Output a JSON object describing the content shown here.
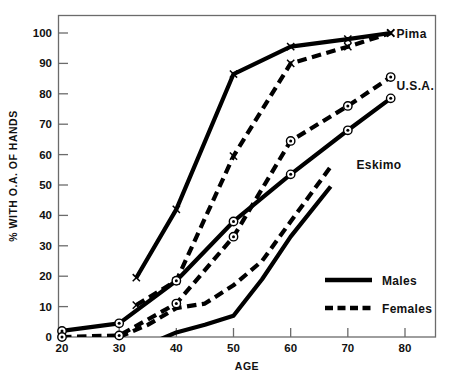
{
  "chart_data": {
    "type": "line",
    "title": "",
    "xlabel": "AGE",
    "ylabel": "% WITH O.A. OF HANDS",
    "xlim": [
      20,
      82
    ],
    "ylim": [
      -3,
      106
    ],
    "xticks": [
      "20",
      "30",
      "40",
      "50",
      "60",
      "70",
      "80"
    ],
    "yticks": [
      "0",
      "10",
      "20",
      "30",
      "40",
      "50",
      "60",
      "70",
      "80",
      "90",
      "100"
    ],
    "grid": false,
    "legend_position": "inside-lower-right",
    "annotations": [
      {
        "text": "Pima",
        "x": 78.5,
        "y": 100
      },
      {
        "text": "U.S.A.",
        "x": 78.5,
        "y": 83
      },
      {
        "text": "Eskimo",
        "x": 71.5,
        "y": 57
      }
    ],
    "legend": [
      {
        "label": "Males",
        "style": "solid"
      },
      {
        "label": "Females",
        "style": "dashed"
      }
    ],
    "series": [
      {
        "name": "Pima Males",
        "group": "Pima",
        "sex": "Males",
        "style": "solid",
        "marker": "x",
        "x": [
          33,
          40,
          50,
          60,
          70,
          77.5
        ],
        "y": [
          19.5,
          42,
          86.5,
          95.5,
          98,
          100
        ]
      },
      {
        "name": "Pima Females",
        "group": "Pima",
        "sex": "Females",
        "style": "dashed",
        "marker": "x",
        "x": [
          33,
          40,
          50,
          60,
          70,
          77.5
        ],
        "y": [
          10.5,
          18.5,
          59.5,
          90,
          95.5,
          100
        ]
      },
      {
        "name": "U.S.A. Males",
        "group": "U.S.A.",
        "sex": "Males",
        "style": "solid",
        "marker": "circle-dot",
        "x": [
          20,
          30,
          40,
          50,
          60,
          70,
          77.5
        ],
        "y": [
          2,
          4.5,
          18.5,
          38,
          53.5,
          68,
          78.5
        ]
      },
      {
        "name": "U.S.A. Females",
        "group": "U.S.A.",
        "sex": "Females",
        "style": "dashed",
        "marker": "circle-dot",
        "x": [
          20,
          30,
          40,
          50,
          60,
          70,
          77.5
        ],
        "y": [
          0,
          0.5,
          11,
          33,
          64.5,
          76,
          85.5
        ]
      },
      {
        "name": "Eskimo Males",
        "group": "Eskimo",
        "sex": "Males",
        "style": "solid",
        "marker": "none",
        "x": [
          35,
          40,
          45,
          50,
          55,
          60,
          67
        ],
        "y": [
          -2.5,
          1.5,
          4,
          7,
          19,
          33,
          49.5
        ]
      },
      {
        "name": "Eskimo Females",
        "group": "Eskimo",
        "sex": "Females",
        "style": "dashed",
        "marker": "none",
        "x": [
          30,
          35,
          40,
          45,
          50,
          55,
          60,
          67
        ],
        "y": [
          0,
          4,
          9.5,
          11,
          17,
          25,
          38,
          56
        ]
      }
    ]
  },
  "axes": {
    "x_title": "AGE",
    "y_title": "% WITH O.A. OF HANDS"
  }
}
